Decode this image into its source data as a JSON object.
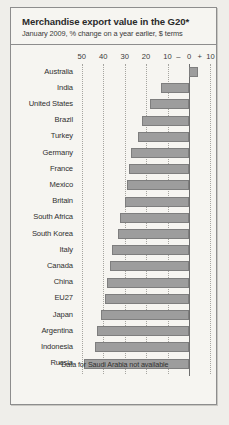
{
  "chart_data": {
    "type": "bar",
    "orientation": "horizontal",
    "title": "Merchandise export value in the G20*",
    "subtitle": "January 2009, % change on a year earlier, $ terms",
    "footnote": "*Data for Saudi Arabia not available",
    "xlabel": "",
    "ylabel": "",
    "xlim": [
      -52,
      12
    ],
    "grid": true,
    "legend": false,
    "tick_labels": [
      "50",
      "40",
      "30",
      "20",
      "10",
      "0",
      "10"
    ],
    "tick_values": [
      -50,
      -40,
      -30,
      -20,
      -10,
      0,
      10
    ],
    "sign_minus": "–",
    "sign_plus": "+",
    "bar_color": "#9d9d9d",
    "categories": [
      "Australia",
      "India",
      "United States",
      "Brazil",
      "Turkey",
      "Germany",
      "France",
      "Mexico",
      "Britain",
      "South Africa",
      "South Korea",
      "Italy",
      "Canada",
      "China",
      "EU27",
      "Japan",
      "Argentina",
      "Indonesia",
      "Russia"
    ],
    "values": [
      4,
      -13,
      -18,
      -22,
      -24,
      -27,
      -28,
      -29,
      -30,
      -32,
      -33,
      -36,
      -37,
      -38,
      -39,
      -41,
      -43,
      -44,
      -49
    ]
  }
}
